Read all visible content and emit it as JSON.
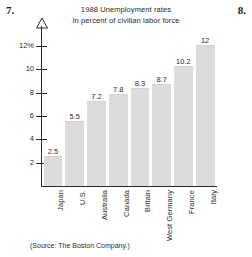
{
  "page": {
    "problem_number_left": "7.",
    "problem_number_right": "8.",
    "source_note": "(Source: The Boston Company.)"
  },
  "chart_data": {
    "type": "bar",
    "title": "1988 Unemployment rates",
    "subtitle": "In percent of civilian labor force",
    "xlabel": "",
    "ylabel": "",
    "categories": [
      "Japan",
      "U.S.",
      "Australia",
      "Canada",
      "Britain",
      "West Germany",
      "France",
      "Italy"
    ],
    "values": [
      2.5,
      5.5,
      7.2,
      7.8,
      8.3,
      8.7,
      10.2,
      12
    ],
    "value_labels": [
      "2.5",
      "5.5",
      "7.2",
      "7.8",
      "8.3",
      "8.7",
      "10.2",
      "12"
    ],
    "ylim": [
      0,
      12
    ],
    "yticks": [
      2,
      4,
      6,
      8,
      10,
      12
    ],
    "ytick_labels": [
      "2",
      "4",
      "6",
      "8",
      "10",
      "12%"
    ],
    "grid": false,
    "legend": false,
    "bar_color": "#dcdcdc",
    "axis_color": "#2b2b2b",
    "annotations": [
      "(Source: The Boston Company.)"
    ]
  }
}
